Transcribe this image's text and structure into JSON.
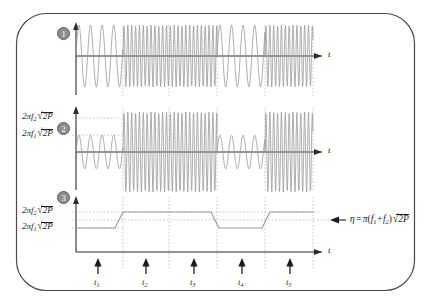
{
  "figure": {
    "border_color": "#4a4a4a",
    "wave_color": "#9a9a9a",
    "axis_color": "#2b2b2b",
    "grid_color": "#b9b9b9",
    "badge_fill": "#8d8d8d",
    "badge_text_color": "#ffffff"
  },
  "panels": [
    {
      "index": "1",
      "badge": "1",
      "axis_label": "t",
      "level_labels": [],
      "waveform": {
        "type": "frequency-shift-keyed sine",
        "description": "alternating low and high frequency bursts, constant amplitude",
        "segments": [
          {
            "from_x": 76,
            "to_x": 123,
            "frequency": "f1",
            "relative_freq": 1,
            "amplitude": 1.0
          },
          {
            "from_x": 123,
            "to_x": 217,
            "frequency": "f2",
            "relative_freq": 3,
            "amplitude": 1.0
          },
          {
            "from_x": 217,
            "to_x": 265,
            "frequency": "f1",
            "relative_freq": 1,
            "amplitude": 1.0
          },
          {
            "from_x": 265,
            "to_x": 313,
            "frequency": "f2",
            "relative_freq": 3,
            "amplitude": 1.0
          }
        ]
      }
    },
    {
      "index": "2",
      "badge": "2",
      "axis_label": "t",
      "level_labels": [
        {
          "id": "level-f2",
          "prefix": "2",
          "pi": "π",
          "f": "f",
          "sub": "2",
          "radicand": "2P"
        },
        {
          "id": "level-f1",
          "prefix": "2",
          "pi": "π",
          "f": "f",
          "sub": "1",
          "radicand": "2P"
        }
      ],
      "waveform": {
        "type": "frequency and amplitude modulated sine",
        "description": "amplitude proportional to frequency; low-frequency bursts have small amplitude, high-frequency bursts reach the upper level",
        "segments": [
          {
            "from_x": 76,
            "to_x": 123,
            "frequency": "f1",
            "relative_freq": 1,
            "amplitude": 0.42
          },
          {
            "from_x": 123,
            "to_x": 217,
            "frequency": "f2",
            "relative_freq": 3,
            "amplitude": 1.0
          },
          {
            "from_x": 217,
            "to_x": 265,
            "frequency": "f1",
            "relative_freq": 1,
            "amplitude": 0.42
          },
          {
            "from_x": 265,
            "to_x": 313,
            "frequency": "f2",
            "relative_freq": 3,
            "amplitude": 1.0
          }
        ]
      }
    },
    {
      "index": "3",
      "badge": "3",
      "axis_label": "t",
      "level_labels": [
        {
          "id": "level-f2",
          "prefix": "2",
          "pi": "π",
          "f": "f",
          "sub": "2",
          "radicand": "2P"
        },
        {
          "id": "level-f1",
          "prefix": "2",
          "pi": "π",
          "f": "f",
          "sub": "1",
          "radicand": "2P"
        }
      ],
      "waveform": {
        "type": "step / staircase",
        "description": "envelope switching between the 2πf1√2P and 2πf2√2P levels with finite-slope transitions",
        "levels": {
          "low": "2πf1√2P",
          "high": "2πf2√2P",
          "threshold": "η"
        },
        "steps": [
          {
            "x": 76,
            "level": "low"
          },
          {
            "x": 111,
            "level": "low"
          },
          {
            "x": 123,
            "level": "high"
          },
          {
            "x": 210,
            "level": "high"
          },
          {
            "x": 219,
            "level": "low"
          },
          {
            "x": 258,
            "level": "low"
          },
          {
            "x": 270,
            "level": "high"
          },
          {
            "x": 313,
            "level": "high"
          }
        ]
      }
    }
  ],
  "annotation": {
    "id": "eta-equation",
    "arrow": "←",
    "eta": "η",
    "equals": "=",
    "pi": "π",
    "open_paren": "(",
    "f": "f",
    "sub1": "1",
    "plus": "+",
    "sub2": "2",
    "close_paren": ")",
    "radicand": "2P",
    "plain": "η = π(f1 + f2)√2P"
  },
  "time_markers": [
    {
      "id": "t1",
      "letter": "t",
      "sub": "1",
      "x": 98
    },
    {
      "id": "t2",
      "letter": "t",
      "sub": "2",
      "x": 146
    },
    {
      "id": "t3",
      "letter": "t",
      "sub": "3",
      "x": 194
    },
    {
      "id": "t4",
      "letter": "t",
      "sub": "4",
      "x": 242
    },
    {
      "id": "t5",
      "letter": "t",
      "sub": "5",
      "x": 290
    }
  ],
  "gridlines_x": [
    123,
    169,
    217,
    265,
    313
  ]
}
